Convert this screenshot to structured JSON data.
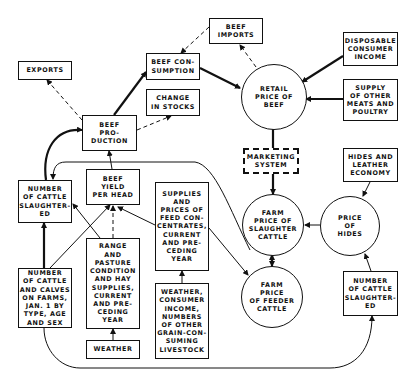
{
  "nodes": {
    "exports": "EXPORTS",
    "beef_consumption": "BEEF CON-\nSUMPTION",
    "change_in_stocks": "CHANGE\nIN STOCKS",
    "beef_imports": "BEEF\nIMPORTS",
    "disposable_consumer_income": "DISPOSABLE\nCONSUMER\nINCOME",
    "supply_other_meats": "SUPPLY\nOF OTHER\nMEATS AND\nPOULTRY",
    "retail_price_beef": "RETAIL\nPRICE OF\nBEEF",
    "beef_production": "BEEF\nPRO-\nDUCTION",
    "marketing_system": "MARKETING\nSYSTEM",
    "hides_leather_economy": "HIDES AND\nLEATHER\nECONOMY",
    "cattle_slaughtered_left": "NUMBER\nOF CATTLE\nSLAUGHTER-\nED",
    "beef_yield_per_head": "BEEF\nYIELD\nPER HEAD",
    "feed_supplies_prices": "SUPPLIES\nAND\nPRICES OF\nFEED CON-\nCENTRATES,\nCURRENT\nAND PRE-\nCEDING\nYEAR",
    "farm_price_slaughter_cattle": "FARM\nPRICE OF\nSLAUGHTER\nCATTLE",
    "price_of_hides": "PRICE\nOF\nHIDES",
    "farm_price_feeder_cattle": "FARM\nPRICE\nOF FEEDER\nCATTLE",
    "cattle_calves_on_farms": "NUMBER\nOF CATTLE\nAND CALVES\nON FARMS,\nJAN. 1 BY\nTYPE, AGE\nAND SEX",
    "range_pasture": "RANGE\nAND\nPASTURE\nCONDITION\nAND HAY\nSUPPLIES,\nCURRENT\nAND PRE-\nCEDING\nYEAR",
    "weather": "WEATHER",
    "weather_income_livestock": "WEATHER,\nCONSUMER\nINCOME,\nNUMBERS\nOF OTHER\nGRAIN-CON-\nSUMING\nLIVESTOCK",
    "cattle_slaughtered_right": "NUMBER\nOF CATTLE\nSLAUGHTER-\nED"
  },
  "colors": {
    "ink": "#111111",
    "background": "#ffffff"
  }
}
